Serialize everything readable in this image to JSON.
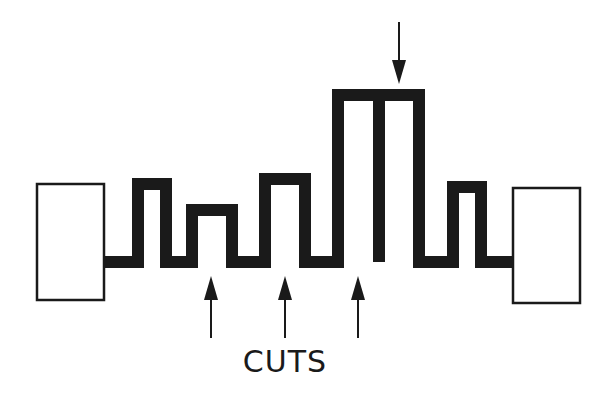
{
  "diagram": {
    "label": "CUTS",
    "colors": {
      "ink": "#1a1a1a",
      "background": "#ffffff"
    },
    "pads": [
      {
        "name": "left-pad",
        "x": 37,
        "y": 184,
        "w": 67,
        "h": 116
      },
      {
        "name": "right-pad",
        "x": 513,
        "y": 188,
        "w": 67,
        "h": 115
      }
    ],
    "trace": {
      "stroke_width": 12,
      "points": [
        [
          104,
          262
        ],
        [
          138,
          262
        ],
        [
          138,
          184
        ],
        [
          166,
          184
        ],
        [
          166,
          262
        ],
        [
          192,
          262
        ],
        [
          192,
          210
        ],
        [
          232,
          210
        ],
        [
          232,
          262
        ],
        [
          265,
          262
        ],
        [
          265,
          179
        ],
        [
          305,
          179
        ],
        [
          305,
          262
        ],
        [
          338,
          262
        ],
        [
          338,
          95
        ],
        [
          419,
          95
        ],
        [
          419,
          262
        ],
        [
          441,
          262
        ]
      ],
      "big_divider": {
        "x": 379,
        "y1": 95,
        "y2": 262
      },
      "tail": [
        [
          441,
          262
        ],
        [
          453,
          262
        ],
        [
          453,
          187
        ],
        [
          481,
          187
        ],
        [
          481,
          262
        ],
        [
          513,
          262
        ]
      ]
    },
    "cut_arrows_up": [
      {
        "x": 211,
        "tip_y": 276,
        "tail_y": 338
      },
      {
        "x": 285,
        "tip_y": 276,
        "tail_y": 338
      },
      {
        "x": 358,
        "tip_y": 276,
        "tail_y": 338
      }
    ],
    "arrow_down": {
      "x": 399,
      "tail_y": 22,
      "tip_y": 84
    },
    "label_pos": {
      "x": 285,
      "y": 344
    }
  }
}
